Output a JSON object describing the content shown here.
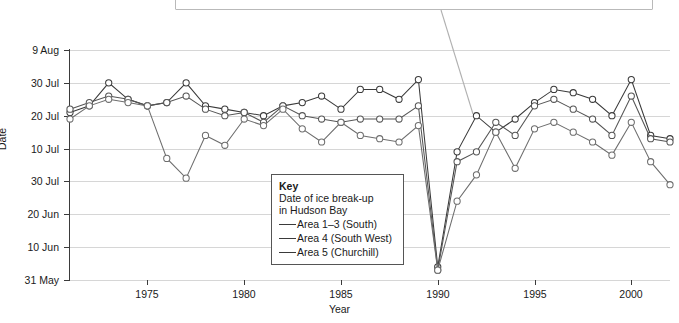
{
  "callout": {
    "text": "Dates of ice break-up have become progressively earlier",
    "leader_from": {
      "x": 441,
      "y": 10
    },
    "leader_to": {
      "x": 473,
      "y": 114
    }
  },
  "axis_title_y": "Date",
  "axis_title_x": "Year",
  "key": {
    "title": "Key",
    "subtitle_line1": "Date of ice break-up",
    "subtitle_line2": "in Hudson Bay",
    "items": [
      {
        "label": "Area 1–3 (South)",
        "color": "#3a3a3a"
      },
      {
        "label": "Area 4 (South West)",
        "color": "#555555"
      },
      {
        "label": "Area 5 (Churchill)",
        "color": "#6d6d6d"
      }
    ]
  },
  "chart_data": {
    "type": "line",
    "title": "Date of ice break-up in Hudson Bay",
    "xlabel": "Year",
    "ylabel": "Date",
    "grid": true,
    "legend_position": "inside-lower-center",
    "xlim": [
      1971,
      2002
    ],
    "xticks": [
      1975,
      1980,
      1985,
      1990,
      1995,
      2000
    ],
    "xticklabels": [
      "1975",
      "1980",
      "1985",
      "1990",
      "1995",
      "2000"
    ],
    "ylim_daynumber": [
      151,
      221
    ],
    "yticks_daynumber": [
      221,
      211,
      201,
      191,
      181,
      171,
      161,
      151
    ],
    "yticklabels": [
      "9 Aug",
      "30 Jul",
      "20 Jul",
      "10 Jul",
      "30 Jul",
      "20 Jun",
      "10 Jun",
      "31 May"
    ],
    "ytick_note": "Fifth label reads '30 Jul' in the source image (apparent typo for '30 Jun')",
    "x": [
      1971,
      1972,
      1973,
      1974,
      1975,
      1976,
      1977,
      1978,
      1979,
      1980,
      1981,
      1982,
      1983,
      1984,
      1985,
      1986,
      1987,
      1988,
      1989,
      1990,
      1991,
      1992,
      1993,
      1994,
      1995,
      1996,
      1997,
      1998,
      1999,
      2000,
      2001,
      2002
    ],
    "series": [
      {
        "name": "Area 1–3 (South)",
        "color": "#3a3a3a",
        "marker": "open-circle",
        "values_daynumber": [
          202,
          204,
          211,
          206,
          204,
          205,
          211,
          204,
          203,
          202,
          201,
          204,
          205,
          207,
          203,
          209,
          209,
          206,
          212,
          155,
          190,
          201,
          196,
          200,
          205,
          209,
          208,
          206,
          201,
          212,
          195,
          194
        ]
      },
      {
        "name": "Area 4 (South West)",
        "color": "#555555",
        "marker": "open-circle",
        "values_daynumber": [
          203,
          205,
          207,
          206,
          204,
          205,
          207,
          203,
          201,
          202,
          199,
          204,
          201,
          200,
          199,
          200,
          200,
          200,
          204,
          154,
          187,
          190,
          199,
          195,
          204,
          206,
          203,
          200,
          195,
          207,
          194,
          193
        ]
      },
      {
        "name": "Area 5 (Churchill)",
        "color": "#6d6d6d",
        "marker": "open-circle",
        "values_daynumber": [
          200,
          204,
          206,
          205,
          204,
          188,
          182,
          195,
          192,
          200,
          198,
          203,
          197,
          193,
          199,
          195,
          194,
          193,
          198,
          154,
          175,
          183,
          196,
          185,
          197,
          199,
          196,
          193,
          189,
          199,
          187,
          180
        ]
      }
    ],
    "annotation": {
      "points_to_year": 1992,
      "points_to_value_daynumber": 201
    }
  }
}
